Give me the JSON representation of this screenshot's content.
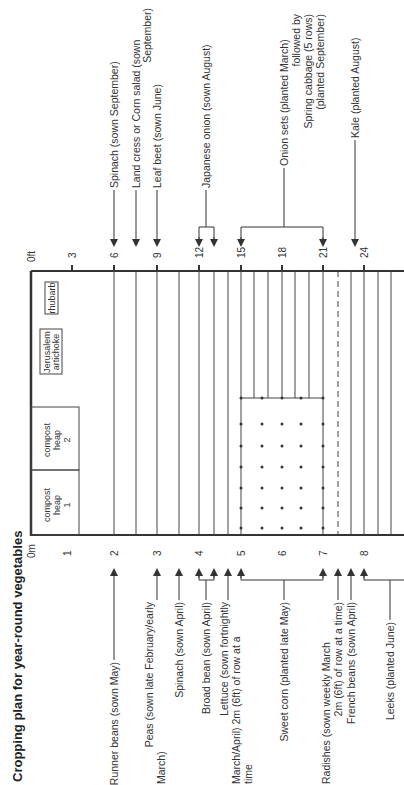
{
  "title": "Cropping plan for year-round vegetables",
  "axes": {
    "feet": {
      "unit_label": "0ft",
      "ticks": [
        "3",
        "6",
        "9",
        "12",
        "15",
        "18",
        "21",
        "24"
      ]
    },
    "metres": {
      "unit_label": "0m",
      "ticks": [
        "1",
        "2",
        "3",
        "4",
        "5",
        "6",
        "7",
        "8"
      ]
    }
  },
  "plots": {
    "compost_heap_1": [
      "compost",
      "heap",
      "1"
    ],
    "compost_heap_2": [
      "compost",
      "heap",
      "2"
    ],
    "jerusalem_artichoke": [
      "Jerusalem",
      "artichoke"
    ],
    "rhubarb": "rhubarb"
  },
  "labels_bottom": [
    {
      "lines": [
        "Runner beans (sown May)"
      ]
    },
    {
      "lines": [
        "Peas (sown late February/early",
        "March)"
      ]
    },
    {
      "lines": [
        "Spinach (sown April)"
      ]
    },
    {
      "lines": [
        "Broad bean (sown April)"
      ]
    },
    {
      "lines": [
        "Lettuce (sown fortnightly",
        "March/April) 2m (6ft) of row at a",
        "time"
      ]
    },
    {
      "lines": [
        "Sweet corn (planted late May)"
      ]
    },
    {
      "lines": [
        "Radishes (sown weekly March",
        "2m (6ft) of row at a time)"
      ]
    },
    {
      "lines": [
        "French beans (sown April)"
      ]
    },
    {
      "lines": [
        "Leeks (planted June)"
      ]
    }
  ],
  "labels_top": [
    {
      "lines": [
        "Spinach (sown September)"
      ]
    },
    {
      "lines": [
        "Land cress or Corn salad (sown",
        "September)"
      ]
    },
    {
      "lines": [
        "Leaf beet (sown June)"
      ]
    },
    {
      "lines": [
        "Japanese onion (sown August)"
      ]
    },
    {
      "lines": [
        "Onion sets (planted March)",
        "followed by",
        "Spring cabbage (5 rows)",
        "(planted September)"
      ]
    },
    {
      "lines": [
        "Kale (planted August)"
      ]
    }
  ],
  "colors": {
    "ink": "#333333",
    "background": "#ffffff"
  }
}
